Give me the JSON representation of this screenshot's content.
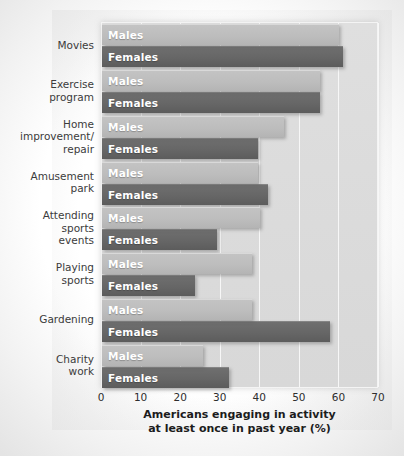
{
  "chart_data": {
    "type": "bar",
    "orientation": "horizontal",
    "title": "",
    "xlabel": "Americans engaging in activity at least once in past year (%)",
    "xlabel_line1": "Americans engaging in activity",
    "xlabel_line2": "at least once in past year (%)",
    "ylabel": "",
    "xlim": [
      0,
      70
    ],
    "xticks": [
      0,
      10,
      20,
      30,
      40,
      50,
      60,
      70
    ],
    "grid": true,
    "grid_axis": "x",
    "legend": "inline-bar-labels",
    "categories": [
      "Movies",
      "Exercise\nprogram",
      "Home\nimprovement/\nrepair",
      "Amusement\npark",
      "Attending\nsports\nevents",
      "Playing\nsports",
      "Gardening",
      "Charity\nwork"
    ],
    "series": [
      {
        "name": "Males",
        "color": "#bdbdbd",
        "values": [
          60,
          55,
          46,
          39.5,
          40,
          38,
          38,
          25.5
        ]
      },
      {
        "name": "Females",
        "color": "#666666",
        "values": [
          61,
          55,
          39.5,
          42,
          29,
          23.5,
          57.5,
          32
        ]
      }
    ]
  },
  "colors": {
    "males_bar": "#bdbdbd",
    "females_bar": "#666666",
    "plot_background": "#dcdcdc",
    "gridline": "#f7f7f7",
    "bar_label_text": "#ffffff",
    "axis_text": "#2e2e2e",
    "category_text": "#3b3b3b"
  }
}
